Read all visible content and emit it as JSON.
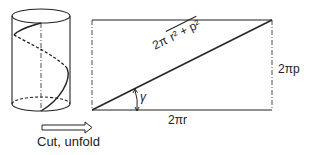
{
  "figure": {
    "cylinder": {
      "description": "cylinder with helix drawn on surface; dashed portion on back side"
    },
    "action_label": "Cut, unfold",
    "arrow": "hollow-right-arrow",
    "rectangle": {
      "hypotenuse_label_prefix": "2π",
      "hypotenuse_label_radicand": "r² + p²",
      "height_label": "2πp",
      "width_label": "2πr",
      "angle_label": "γ"
    },
    "colors": {
      "line": "#222222",
      "background": "#ffffff"
    }
  }
}
